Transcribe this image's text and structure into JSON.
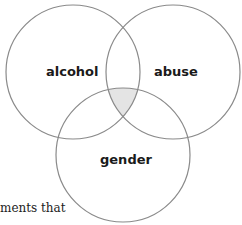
{
  "diagram": {
    "type": "venn",
    "sets": [
      {
        "label": "alcohol",
        "cx": 73,
        "cy": 72,
        "r": 67
      },
      {
        "label": "abuse",
        "cx": 173,
        "cy": 72,
        "r": 67
      },
      {
        "label": "gender",
        "cx": 123,
        "cy": 155,
        "r": 67
      }
    ],
    "highlighted_region": "alcohol ∩ abuse ∩ gender",
    "colors": {
      "stroke": "#8a8a8a",
      "highlight": "#e4e4e4",
      "text": "#1a1a1a"
    }
  },
  "caption": {
    "text": "ments that"
  }
}
